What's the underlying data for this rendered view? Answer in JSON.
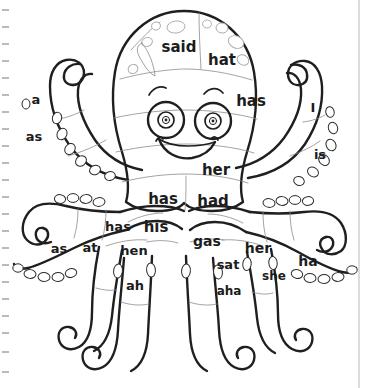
{
  "page": {
    "background_color": "#ffffff",
    "ink_color": "#1f1f1f",
    "guide_color": "#a8a8a8",
    "width": 368,
    "height": 388
  },
  "margin": {
    "left_tick_count": 22,
    "right_rule_label": "page-edge-rule"
  },
  "subject": {
    "name": "octopus",
    "description": "Line-art octopus coloring page divided into segments, each labeled with a sight word"
  },
  "words": [
    {
      "id": "w-said",
      "text": "said",
      "region": "head-top-left",
      "x": 179,
      "y": 47,
      "size": 15
    },
    {
      "id": "w-hat",
      "text": "hat",
      "region": "head-top-right",
      "x": 222,
      "y": 60,
      "size": 15
    },
    {
      "id": "w-has-1",
      "text": "has",
      "region": "head-right-cheek",
      "x": 251,
      "y": 101,
      "size": 15
    },
    {
      "id": "w-her-1",
      "text": "her",
      "region": "head-lower",
      "x": 216,
      "y": 170,
      "size": 15
    },
    {
      "id": "w-has-2",
      "text": "has",
      "region": "body-left",
      "x": 163,
      "y": 199,
      "size": 15
    },
    {
      "id": "w-had",
      "text": "had",
      "region": "body-right",
      "x": 213,
      "y": 201,
      "size": 15
    },
    {
      "id": "w-his",
      "text": "his",
      "region": "body-lower-center",
      "x": 156,
      "y": 227,
      "size": 15
    },
    {
      "id": "w-has-3",
      "text": "has",
      "region": "arm-inner-left-upper",
      "x": 118,
      "y": 227,
      "size": 13
    },
    {
      "id": "w-gas",
      "text": "gas",
      "region": "arm-inner-right",
      "x": 207,
      "y": 242,
      "size": 14
    },
    {
      "id": "w-her-2",
      "text": "her",
      "region": "arm-mid-right",
      "x": 258,
      "y": 249,
      "size": 14
    },
    {
      "id": "w-as-1",
      "text": "as",
      "region": "arm-outer-left",
      "x": 59,
      "y": 249,
      "size": 13
    },
    {
      "id": "w-at",
      "text": "at",
      "region": "arm-left-second",
      "x": 90,
      "y": 248,
      "size": 13
    },
    {
      "id": "w-hen",
      "text": "hen",
      "region": "arm-left-third",
      "x": 134,
      "y": 251,
      "size": 13
    },
    {
      "id": "w-sat",
      "text": "sat",
      "region": "arm-right-inner-low",
      "x": 228,
      "y": 265,
      "size": 13
    },
    {
      "id": "w-she",
      "text": "she",
      "region": "arm-right-mid-low",
      "x": 274,
      "y": 276,
      "size": 12
    },
    {
      "id": "w-ha",
      "text": "ha",
      "region": "arm-outer-right",
      "x": 308,
      "y": 262,
      "size": 14
    },
    {
      "id": "w-ah",
      "text": "ah",
      "region": "leg-left-lower",
      "x": 135,
      "y": 286,
      "size": 13
    },
    {
      "id": "w-aha",
      "text": "aha",
      "region": "leg-right-lower",
      "x": 229,
      "y": 291,
      "size": 12
    },
    {
      "id": "w-a",
      "text": "a",
      "region": "tentacle-upper-left",
      "x": 36,
      "y": 100,
      "size": 13
    },
    {
      "id": "w-as-2",
      "text": "as",
      "region": "tentacle-left-lower",
      "x": 34,
      "y": 137,
      "size": 13
    },
    {
      "id": "w-I",
      "text": "I",
      "region": "tentacle-upper-right",
      "x": 313,
      "y": 108,
      "size": 13
    },
    {
      "id": "w-is",
      "text": "is",
      "region": "tentacle-right-lower",
      "x": 320,
      "y": 155,
      "size": 13
    }
  ]
}
